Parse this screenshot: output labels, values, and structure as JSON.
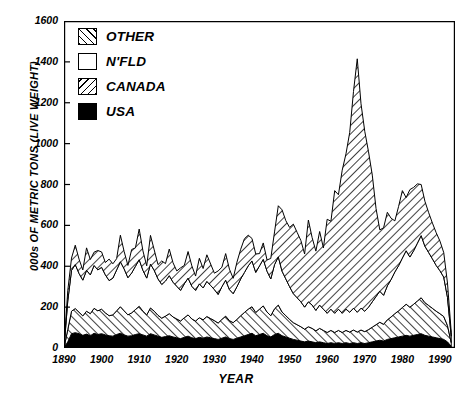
{
  "chart_data": {
    "type": "area",
    "title": "",
    "subtitle": "",
    "xlabel": "YEAR",
    "ylabel": "000s OF METRIC TONS (LIVE WEIGHT)",
    "stacked": true,
    "grid": false,
    "legend_position": "top-left",
    "xlim": [
      1890,
      1994
    ],
    "ylim": [
      0,
      1600
    ],
    "yticks": [
      0,
      200,
      400,
      600,
      800,
      1000,
      1200,
      1400,
      1600
    ],
    "ytick_labels": [
      "0",
      "200",
      "400",
      "600",
      "800",
      "1000",
      "1200",
      "1400",
      "1600"
    ],
    "xticks": [
      1890,
      1900,
      1910,
      1920,
      1930,
      1940,
      1950,
      1960,
      1970,
      1980,
      1990
    ],
    "xtick_labels": [
      "1890",
      "1900",
      "1910",
      "1920",
      "1930",
      "1940",
      "1950",
      "1960",
      "1970",
      "1980",
      "1990"
    ],
    "x": [
      1890,
      1891,
      1892,
      1893,
      1894,
      1895,
      1896,
      1897,
      1898,
      1899,
      1900,
      1901,
      1902,
      1903,
      1904,
      1905,
      1906,
      1907,
      1908,
      1909,
      1910,
      1911,
      1912,
      1913,
      1914,
      1915,
      1916,
      1917,
      1918,
      1919,
      1920,
      1921,
      1922,
      1923,
      1924,
      1925,
      1926,
      1927,
      1928,
      1929,
      1930,
      1931,
      1932,
      1933,
      1934,
      1935,
      1936,
      1937,
      1938,
      1939,
      1940,
      1941,
      1942,
      1943,
      1944,
      1945,
      1946,
      1947,
      1948,
      1949,
      1950,
      1951,
      1952,
      1953,
      1954,
      1955,
      1956,
      1957,
      1958,
      1959,
      1960,
      1961,
      1962,
      1963,
      1964,
      1965,
      1966,
      1967,
      1968,
      1969,
      1970,
      1971,
      1972,
      1973,
      1974,
      1975,
      1976,
      1977,
      1978,
      1979,
      1980,
      1981,
      1982,
      1983,
      1984,
      1985,
      1986,
      1987,
      1988,
      1989,
      1990,
      1991,
      1992,
      1993
    ],
    "series": [
      {
        "name": "USA",
        "fill": "solid-black",
        "values": [
          0,
          30,
          70,
          75,
          70,
          62,
          68,
          60,
          72,
          66,
          70,
          64,
          60,
          58,
          66,
          72,
          64,
          58,
          60,
          66,
          70,
          64,
          58,
          70,
          64,
          58,
          52,
          56,
          60,
          54,
          50,
          46,
          52,
          58,
          50,
          46,
          52,
          48,
          54,
          50,
          46,
          42,
          48,
          54,
          46,
          42,
          48,
          54,
          60,
          66,
          72,
          60,
          66,
          72,
          60,
          54,
          66,
          72,
          60,
          54,
          48,
          42,
          38,
          34,
          30,
          34,
          30,
          26,
          30,
          26,
          22,
          26,
          22,
          26,
          22,
          26,
          22,
          26,
          22,
          26,
          22,
          26,
          30,
          34,
          38,
          34,
          42,
          46,
          50,
          54,
          58,
          62,
          58,
          62,
          66,
          70,
          62,
          58,
          54,
          50,
          46,
          42,
          30,
          8
        ]
      },
      {
        "name": "CANADA",
        "fill": "forward-hatch",
        "values": [
          0,
          60,
          110,
          118,
          105,
          95,
          112,
          108,
          122,
          116,
          120,
          108,
          98,
          104,
          116,
          130,
          118,
          104,
          112,
          122,
          134,
          116,
          104,
          126,
          116,
          102,
          94,
          100,
          108,
          98,
          92,
          86,
          96,
          104,
          92,
          86,
          96,
          90,
          100,
          94,
          88,
          80,
          92,
          102,
          88,
          82,
          92,
          104,
          114,
          124,
          130,
          114,
          124,
          134,
          116,
          104,
          126,
          138,
          116,
          104,
          92,
          82,
          76,
          70,
          62,
          70,
          66,
          58,
          66,
          60,
          54,
          60,
          54,
          60,
          54,
          60,
          56,
          62,
          56,
          62,
          58,
          64,
          72,
          80,
          88,
          82,
          96,
          106,
          118,
          128,
          140,
          152,
          142,
          152,
          164,
          176,
          160,
          150,
          140,
          130,
          122,
          112,
          80,
          18
        ]
      },
      {
        "name": "N'FLD",
        "fill": "white",
        "values": [
          0,
          140,
          200,
          215,
          190,
          175,
          200,
          190,
          210,
          200,
          205,
          186,
          172,
          180,
          200,
          220,
          205,
          182,
          195,
          212,
          228,
          200,
          180,
          215,
          200,
          178,
          165,
          172,
          186,
          170,
          160,
          150,
          166,
          180,
          160,
          150,
          166,
          156,
          172,
          162,
          152,
          140,
          160,
          176,
          152,
          142,
          160,
          180,
          196,
          212,
          224,
          196,
          212,
          228,
          200,
          180,
          216,
          236,
          200,
          180,
          160,
          142,
          132,
          122,
          108,
          122,
          114,
          100,
          114,
          104,
          94,
          104,
          94,
          104,
          94,
          104,
          97,
          107,
          97,
          107,
          100,
          110,
          124,
          138,
          152,
          142,
          166,
          183,
          204,
          221,
          242,
          262,
          245,
          262,
          283,
          304,
          276,
          259,
          242,
          224,
          210,
          193,
          138,
          31
        ]
      },
      {
        "name": "OTHER",
        "fill": "back-hatch",
        "values": [
          0,
          50,
          60,
          95,
          70,
          50,
          110,
          75,
          65,
          95,
          75,
          60,
          105,
          70,
          55,
          130,
          85,
          60,
          115,
          90,
          150,
          95,
          60,
          140,
          100,
          70,
          115,
          85,
          130,
          95,
          75,
          110,
          90,
          130,
          100,
          70,
          125,
          95,
          130,
          105,
          80,
          115,
          95,
          130,
          100,
          75,
          120,
          145,
          165,
          150,
          110,
          90,
          60,
          80,
          55,
          100,
          160,
          250,
          300,
          285,
          290,
          340,
          320,
          300,
          260,
          400,
          330,
          290,
          360,
          300,
          460,
          430,
          600,
          560,
          700,
          760,
          880,
          1060,
          1240,
          1000,
          880,
          760,
          620,
          430,
          300,
          330,
          360,
          300,
          250,
          290,
          330,
          260,
          330,
          310,
          290,
          250,
          220,
          195,
          175,
          160,
          145,
          120,
          70,
          20
        ]
      }
    ],
    "notes": {
      "peak_other_value": 1470,
      "peak_other_year": 1968,
      "series_order_bottom_to_top": [
        "USA",
        "CANADA",
        "N'FLD",
        "OTHER"
      ]
    }
  },
  "legend": {
    "items": [
      {
        "label": "OTHER",
        "swatch": "back-hatch"
      },
      {
        "label": "N'FLD",
        "swatch": "white"
      },
      {
        "label": "CANADA",
        "swatch": "forward-hatch"
      },
      {
        "label": "USA",
        "swatch": "solid-black"
      }
    ]
  },
  "colors": {
    "ink": "#000000",
    "background": "#ffffff"
  }
}
